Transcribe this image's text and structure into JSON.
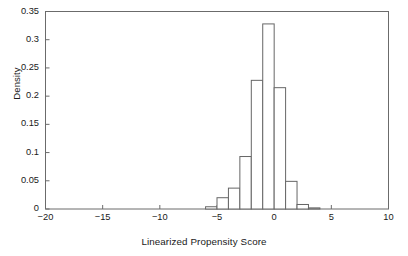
{
  "chart_data": {
    "type": "bar",
    "title": "",
    "subtitle": "",
    "xlabel": "Linearized Propensity Score",
    "ylabel": "Density",
    "xlim": [
      -20,
      10
    ],
    "ylim": [
      0,
      0.35
    ],
    "grid": false,
    "legend": null,
    "bin_width": 1,
    "xticks": [
      -20,
      -15,
      -10,
      -5,
      0,
      5,
      10
    ],
    "xtick_labels": [
      "−20",
      "−15",
      "−10",
      "−5",
      "0",
      "5",
      "10"
    ],
    "yticks": [
      0,
      0.05,
      0.1,
      0.15,
      0.2,
      0.25,
      0.3,
      0.35
    ],
    "ytick_labels": [
      "0",
      "0.05",
      "0.1",
      "0.15",
      "0.2",
      "0.25",
      "0.3",
      "0.35"
    ],
    "bin_edges": [
      -6,
      -5,
      -4,
      -3,
      -2,
      -1,
      0,
      1,
      2,
      3,
      4
    ],
    "categories": [
      "-6 to -5",
      "-5 to -4",
      "-4 to -3",
      "-3 to -2",
      "-2 to -1",
      "-1 to 0",
      "0 to 1",
      "1 to 2",
      "2 to 3",
      "3 to 4"
    ],
    "values": [
      0.004,
      0.02,
      0.037,
      0.093,
      0.228,
      0.328,
      0.215,
      0.049,
      0.008,
      0.002
    ],
    "bar_fill": "#ffffff",
    "bar_stroke": "#666666",
    "axis_color": "#6b6b6b",
    "text_color": "#1a1a1a"
  },
  "figure": {
    "background": "#ffffff"
  }
}
